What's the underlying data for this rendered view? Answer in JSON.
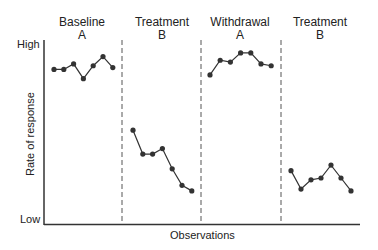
{
  "chart_data": {
    "type": "line",
    "title": "",
    "xlabel": "Observations",
    "ylabel": "Rate of response",
    "y_tick_labels": [
      "Low",
      "High"
    ],
    "ylim": [
      0,
      10
    ],
    "grid": false,
    "legend": null,
    "phases": [
      {
        "name": "Baseline",
        "code": "A",
        "x": [
          1,
          2,
          3,
          4,
          5,
          6,
          7
        ],
        "values": [
          8.4,
          8.4,
          8.7,
          7.9,
          8.6,
          9.1,
          8.5
        ]
      },
      {
        "name": "Treatment",
        "code": "B",
        "x": [
          8,
          9,
          10,
          11,
          12,
          13,
          14
        ],
        "values": [
          5.1,
          3.8,
          3.8,
          4.1,
          3.0,
          2.1,
          1.8
        ]
      },
      {
        "name": "Withdrawal",
        "code": "A",
        "x": [
          15,
          16,
          17,
          18,
          19,
          20,
          21
        ],
        "values": [
          8.1,
          8.9,
          8.8,
          9.3,
          9.3,
          8.7,
          8.6
        ]
      },
      {
        "name": "Treatment",
        "code": "B",
        "x": [
          22,
          23,
          24,
          25,
          26,
          27,
          28
        ],
        "values": [
          2.9,
          1.9,
          2.4,
          2.5,
          3.2,
          2.5,
          1.8
        ]
      }
    ],
    "phase_dividers": "dashed vertical lines between phases",
    "annotations": []
  },
  "labels": {
    "phase_1_name": "Baseline",
    "phase_1_code": "A",
    "phase_2_name": "Treatment",
    "phase_2_code": "B",
    "phase_3_name": "Withdrawal",
    "phase_3_code": "A",
    "phase_4_name": "Treatment",
    "phase_4_code": "B",
    "y_high": "High",
    "y_low": "Low",
    "y_title": "Rate of response",
    "x_title": "Observations"
  },
  "colors": {
    "line": "#333333",
    "marker": "#333333",
    "axis": "#333333",
    "divider": "#555555"
  }
}
